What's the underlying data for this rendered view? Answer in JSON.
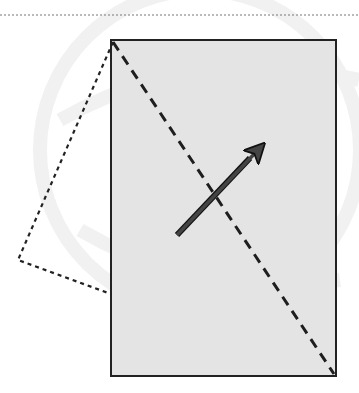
{
  "colors": {
    "background": "#ffffff",
    "rect_fill": "#e4e4e4",
    "rect_stroke": "#222222",
    "dash": "#1e1e1e",
    "arrow": "#444444",
    "watermark": "#f2f2f2"
  },
  "diagram": {
    "top_dotted_line": {
      "x1": 0,
      "y1": 15,
      "x2": 359,
      "y2": 15
    },
    "rectangle": {
      "x": 111,
      "y": 40,
      "width": 225,
      "height": 336
    },
    "diagonal_fold_line": {
      "x1": 113,
      "y1": 42,
      "x2": 334,
      "y2": 374
    },
    "folded_flap": {
      "points": "113,42 18,260 111,294"
    },
    "arrow": {
      "x1": 177,
      "y1": 235,
      "x2": 258,
      "y2": 150
    }
  }
}
